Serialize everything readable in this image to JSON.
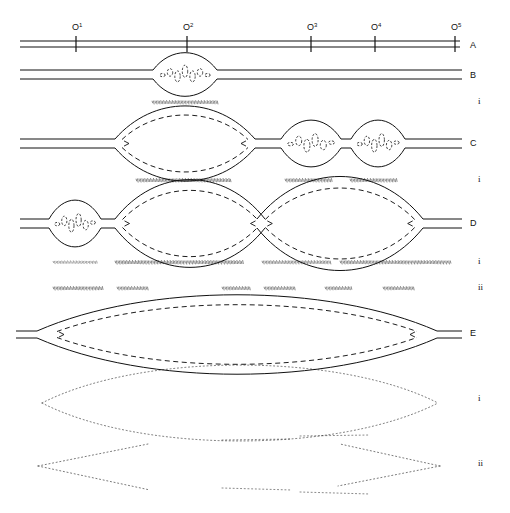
{
  "figure": {
    "title": "",
    "background": "#ffffff",
    "ink": "#111111",
    "width": 510,
    "height": 513
  },
  "scale": {
    "axis_row_label": "A",
    "ticks": [
      {
        "id": "o1",
        "base": "O",
        "exp": "1",
        "x": 76
      },
      {
        "id": "o2",
        "base": "O",
        "exp": "2",
        "x": 187
      },
      {
        "id": "o3",
        "base": "O",
        "exp": "3",
        "x": 311
      },
      {
        "id": "o4",
        "base": "O",
        "exp": "4",
        "x": 375
      },
      {
        "id": "o5",
        "base": "O",
        "exp": "5",
        "x": 455
      }
    ]
  },
  "rows": [
    {
      "key": "A",
      "label": "A",
      "label_x": 470,
      "label_y": 48,
      "kind": "axis",
      "line_y_top": 41,
      "line_y_bottom": 47,
      "x_start": 20,
      "x_end": 460,
      "nodes": []
    },
    {
      "key": "B",
      "label": "B",
      "label_x": 470,
      "label_y": 78,
      "kind": "strand",
      "line_y_top": 70,
      "line_y_bottom": 79,
      "x_start": 20,
      "x_end": 462,
      "nodes": [
        {
          "cx": 185,
          "half_w": 32,
          "half_h": 11,
          "inner": true,
          "dash_cells": 7
        }
      ],
      "bands": [
        {
          "tier": "i",
          "label": "i",
          "label_x": 478,
          "label_y": 104,
          "segments": [
            {
              "x": 152,
              "w": 68,
              "y": 102,
              "density": 0.85
            }
          ]
        }
      ]
    },
    {
      "key": "C",
      "label": "C",
      "label_x": 470,
      "label_y": 146,
      "kind": "strand",
      "line_y_top": 139,
      "line_y_bottom": 148,
      "x_start": 20,
      "x_end": 462,
      "nodes": [
        {
          "cx": 185,
          "half_w": 70,
          "half_h": 21,
          "inner": true,
          "dash_cells": 0
        },
        {
          "cx": 311,
          "half_w": 30,
          "half_h": 12,
          "inner": true,
          "dash_cells": 6
        },
        {
          "cx": 378,
          "half_w": 27,
          "half_h": 12,
          "inner": true,
          "dash_cells": 6
        }
      ],
      "bands": [
        {
          "tier": "i",
          "label": "i",
          "label_x": 478,
          "label_y": 182,
          "segments": [
            {
              "x": 136,
              "w": 96,
              "y": 180,
              "density": 0.95
            },
            {
              "x": 285,
              "w": 48,
              "y": 180,
              "density": 0.9
            },
            {
              "x": 350,
              "w": 48,
              "y": 180,
              "density": 0.9
            }
          ]
        }
      ]
    },
    {
      "key": "D",
      "label": "D",
      "label_x": 470,
      "label_y": 226,
      "kind": "strand",
      "line_y_top": 219,
      "line_y_bottom": 228,
      "x_start": 20,
      "x_end": 462,
      "nodes": [
        {
          "cx": 75,
          "half_w": 26,
          "half_h": 12,
          "inner": true,
          "dash_cells": 6
        },
        {
          "cx": 190,
          "half_w": 75,
          "half_h": 25,
          "inner": true,
          "dash_cells": 0
        },
        {
          "cx": 340,
          "half_w": 83,
          "half_h": 27,
          "inner": true,
          "dash_cells": 0
        }
      ],
      "bands": [
        {
          "tier": "i",
          "label": "i",
          "label_x": 478,
          "label_y": 264,
          "segments": [
            {
              "x": 53,
              "w": 45,
              "y": 262,
              "density": 0.5
            },
            {
              "x": 115,
              "w": 130,
              "y": 262,
              "density": 0.95
            },
            {
              "x": 262,
              "w": 70,
              "y": 262,
              "density": 0.8
            },
            {
              "x": 340,
              "w": 112,
              "y": 262,
              "density": 0.9
            }
          ]
        },
        {
          "tier": "ii",
          "label": "ii",
          "label_x": 478,
          "label_y": 290,
          "segments": [
            {
              "x": 53,
              "w": 52,
              "y": 288,
              "density": 0.9
            },
            {
              "x": 117,
              "w": 32,
              "y": 288,
              "density": 0.85
            },
            {
              "x": 222,
              "w": 30,
              "y": 288,
              "density": 0.85
            },
            {
              "x": 264,
              "w": 32,
              "y": 288,
              "density": 0.85
            },
            {
              "x": 325,
              "w": 28,
              "y": 288,
              "density": 0.85
            },
            {
              "x": 383,
              "w": 32,
              "y": 288,
              "density": 0.85
            }
          ]
        }
      ]
    },
    {
      "key": "E",
      "label": "E",
      "label_x": 470,
      "label_y": 336,
      "kind": "strand",
      "line_y_top": 331,
      "line_y_bottom": 338,
      "x_start": 16,
      "x_end": 462,
      "nodes": [
        {
          "cx": 237,
          "half_w": 200,
          "half_h": 23,
          "inner": true,
          "dash_cells": 0
        }
      ],
      "bands": []
    }
  ],
  "dotted_curves": [
    {
      "tier": "i",
      "label": "i",
      "label_x": 478,
      "label_y": 401,
      "kind": "lens-open",
      "cx": 240,
      "half_w": 198,
      "top_h": 22,
      "bottom_h": 22,
      "y": 403
    },
    {
      "tier": "ii",
      "label": "ii",
      "label_x": 478,
      "label_y": 466,
      "kind": "chevron-pair",
      "left_x": 38,
      "right_x": 440,
      "y": 466,
      "spread": 22
    }
  ],
  "legend": {
    "tier_i": "i",
    "tier_ii": "ii"
  }
}
